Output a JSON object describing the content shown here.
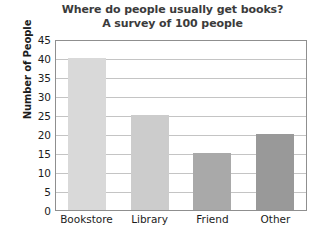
{
  "chart_data": {
    "type": "bar",
    "title": "Where do people usually get books?",
    "subtitle": "A survey of 100 people",
    "xlabel": "",
    "ylabel": "Number of People",
    "categories": [
      "Bookstore",
      "Library",
      "Friend",
      "Other"
    ],
    "values": [
      40,
      25,
      15,
      20
    ],
    "bar_colors": [
      "#d9d9d9",
      "#cccccc",
      "#a9a9a9",
      "#999999"
    ],
    "ylim": [
      0,
      45
    ],
    "ytick_step": 5,
    "yticks": [
      45,
      40,
      35,
      30,
      25,
      20,
      15,
      10,
      5,
      0
    ],
    "grid": true,
    "grid_axis": "y",
    "legend": "none",
    "axis_color": "#8f8f8f",
    "grid_color": "#c4c4c4",
    "title_color": "#3b3b3b",
    "text_color": "#1c1c1c",
    "background": "#ffffff"
  }
}
